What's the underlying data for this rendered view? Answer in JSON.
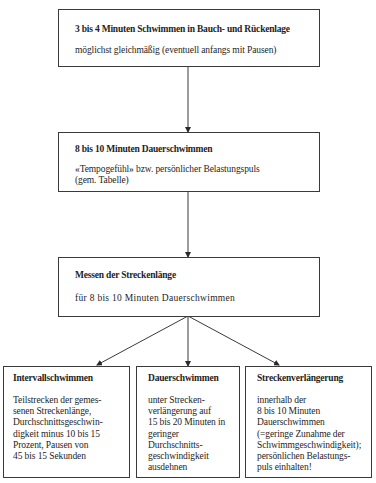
{
  "diagram": {
    "nodes": [
      {
        "id": "step1",
        "title": "3 bis 4 Minuten Schwimmen in Bauch- und Rückenlage",
        "text": "möglichst gleichmäßig (eventuell anfangs mit Pausen)"
      },
      {
        "id": "step2",
        "title": "8 bis 10 Minuten Dauerschwimmen",
        "text_line1": "«Tempogefühl» bzw. persönlicher Belastungspuls",
        "text_line2": "(gem. Tabelle)"
      },
      {
        "id": "step3",
        "title": "Messen der Streckenlänge",
        "text": "für 8 bis 10 Minuten Dauerschwimmen"
      },
      {
        "id": "option-interval",
        "title": "Intervallschwimmen",
        "lines": [
          "Teilstrecken der gemes-",
          "senen Streckenlänge,",
          "Durchschnittsgeschwin-",
          "digkeit minus 10 bis 15",
          "Prozent, Pausen von",
          "45 bis 15 Sekunden"
        ]
      },
      {
        "id": "option-endurance",
        "title": "Dauerschwimmen",
        "lines": [
          "unter Strecken-",
          "verlängerung auf",
          "15 bis 20 Minuten in",
          "geringer",
          "Durchschnitts-",
          "geschwindigkeit",
          "ausdehnen"
        ]
      },
      {
        "id": "option-extension",
        "title": "Streckenverlängerung",
        "lines": [
          "innerhalb der",
          "8 bis 10 Minuten",
          "Dauerschwimmen",
          "(=geringe Zunahme der",
          "Schwimmgeschwindigkeit);",
          "persönlichen Belastungs-",
          "puls einhalten!"
        ]
      }
    ],
    "edges": [
      {
        "from": "step1",
        "to": "step2"
      },
      {
        "from": "step2",
        "to": "step3"
      },
      {
        "from": "step3",
        "to": "option-interval"
      },
      {
        "from": "step3",
        "to": "option-endurance"
      },
      {
        "from": "step3",
        "to": "option-extension"
      }
    ],
    "colors": {
      "line": "#3a3a3a",
      "text": "#1e1e1e",
      "background": "#ffffff"
    }
  }
}
